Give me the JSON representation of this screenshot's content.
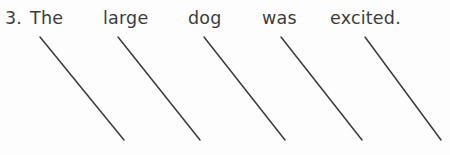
{
  "page": {
    "background_color": "#fdfdfd",
    "ink_color": "#3c3c3c",
    "line_color": "#3a3a3a"
  },
  "exercise": {
    "item_number": "3.",
    "sentence_text": "The large dog was excited.",
    "words": [
      {
        "label": "The",
        "x": 30
      },
      {
        "label": "large",
        "x": 103
      },
      {
        "label": "dog",
        "x": 188
      },
      {
        "label": "was",
        "x": 262
      },
      {
        "label": "excited.",
        "x": 330
      }
    ],
    "answer_lines": [
      {
        "name": "answer-line-1",
        "x1": 40,
        "y1": 37,
        "x2": 124,
        "y2": 140
      },
      {
        "name": "answer-line-2",
        "x1": 118,
        "y1": 37,
        "x2": 200,
        "y2": 140
      },
      {
        "name": "answer-line-3",
        "x1": 204,
        "y1": 37,
        "x2": 285,
        "y2": 140
      },
      {
        "name": "answer-line-4",
        "x1": 281,
        "y1": 37,
        "x2": 362,
        "y2": 140
      },
      {
        "name": "answer-line-5",
        "x1": 365,
        "y1": 37,
        "x2": 441,
        "y2": 140
      }
    ]
  }
}
